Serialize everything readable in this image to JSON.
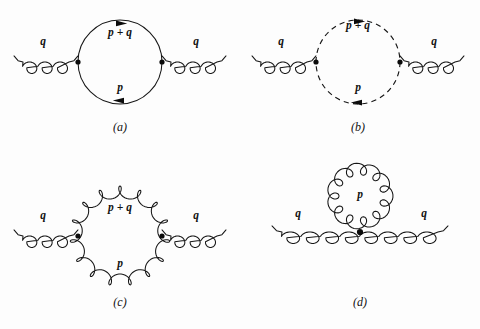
{
  "figure": {
    "background_color": "#fdfdfd",
    "line_color": "#161616",
    "label_color": "#111111"
  },
  "panels": [
    {
      "id": "a",
      "caption": "(a)",
      "loop_type": "fermion",
      "loop_style": "solid",
      "external_left_label": "q",
      "external_right_label": "q",
      "top_label": "p + q",
      "bottom_label": "p",
      "top_arrow_direction": "right",
      "bottom_arrow_direction": "left",
      "vertex_count": 2
    },
    {
      "id": "b",
      "caption": "(b)",
      "loop_type": "ghost",
      "loop_style": "dashed",
      "external_left_label": "q",
      "external_right_label": "q",
      "top_label": "p + q",
      "bottom_label": "p",
      "top_arrow_direction": "right",
      "bottom_arrow_direction": "left",
      "vertex_count": 2
    },
    {
      "id": "c",
      "caption": "(c)",
      "loop_type": "gluon",
      "loop_style": "coiled",
      "external_left_label": "q",
      "external_right_label": "q",
      "top_label": "p + q",
      "bottom_label": "p",
      "top_arrow_direction": "none",
      "bottom_arrow_direction": "none",
      "vertex_count": 2
    },
    {
      "id": "d",
      "caption": "(d)",
      "loop_type": "gluon-tadpole",
      "loop_style": "coiled",
      "external_left_label": "q",
      "external_right_label": "q",
      "top_label": "p",
      "bottom_label": "",
      "top_arrow_direction": "none",
      "bottom_arrow_direction": "none",
      "vertex_count": 1
    }
  ]
}
